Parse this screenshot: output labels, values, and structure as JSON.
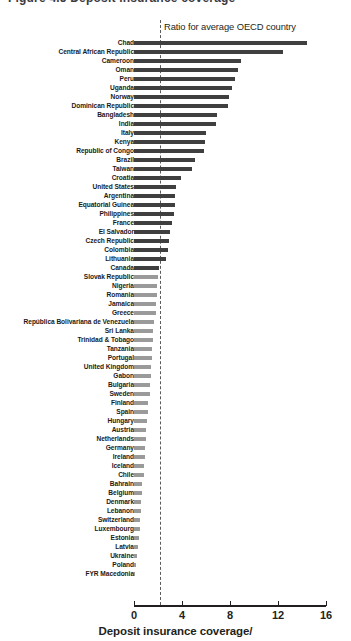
{
  "figure": {
    "partial_title": "Figure 4.5   Deposit insurance coverage",
    "annotation": "Ratio for average OECD country"
  },
  "axis": {
    "ticks": [
      "0",
      "4",
      "8",
      "12",
      "16"
    ],
    "title": "Deposit insurance coverage/"
  },
  "colors": {
    "bar_above": "#3f3f3f",
    "bar_below": "#9a9a9a",
    "axis": "#231f20",
    "reference_line": "#5a5a5a"
  },
  "chart_data": {
    "type": "bar",
    "orientation": "horizontal",
    "title": "Deposit insurance coverage",
    "xlabel": "Deposit insurance coverage/",
    "ylabel": "",
    "xlim": [
      0,
      16
    ],
    "xticks": [
      0,
      4,
      8,
      12,
      16
    ],
    "grid": false,
    "legend": false,
    "annotations": [
      {
        "text": "Ratio for average OECD country",
        "type": "reference-line",
        "x": 2.1,
        "style": "dashed-vertical"
      }
    ],
    "categories": [
      "Chad",
      "Central African Republic",
      "Cameroon",
      "Oman",
      "Peru",
      "Uganda",
      "Norway",
      "Dominican Republic",
      "Bangladesh",
      "India",
      "Italy",
      "Kenya",
      "Republic of Congo",
      "Brazil",
      "Taiwan",
      "Croatia",
      "United States",
      "Argentina",
      "Equatorial Guinea",
      "Philippines",
      "France",
      "El Salvador",
      "Czech Republic",
      "Colombia",
      "Lithuania",
      "Canada",
      "Slovak Republic",
      "Nigeria",
      "Romania",
      "Jamaica",
      "Greece",
      "República Bolivariana de Venezuela",
      "Sri Lanka",
      "Trinidad & Tobago",
      "Tanzania",
      "Portugal",
      "United Kingdom",
      "Gabon",
      "Bulgaria",
      "Sweden",
      "Finland",
      "Spain",
      "Hungary",
      "Austria",
      "Netherlands",
      "Germany",
      "Ireland",
      "Iceland",
      "Chile",
      "Bahrain",
      "Belgium",
      "Denmark",
      "Lebanon",
      "Switzerland",
      "Luxembourg",
      "Estonia",
      "Latvia",
      "Ukraine",
      "Poland",
      "FYR Macedonia"
    ],
    "values": [
      14.4,
      12.4,
      8.9,
      8.7,
      8.4,
      8.2,
      7.9,
      7.8,
      6.9,
      6.8,
      6.0,
      5.9,
      5.8,
      5.1,
      4.8,
      3.9,
      3.5,
      3.4,
      3.4,
      3.3,
      3.2,
      3.0,
      2.9,
      2.8,
      2.7,
      2.1,
      2.0,
      1.9,
      1.9,
      1.8,
      1.8,
      1.7,
      1.6,
      1.6,
      1.5,
      1.5,
      1.4,
      1.4,
      1.3,
      1.3,
      1.2,
      1.2,
      1.1,
      1.0,
      1.0,
      0.9,
      0.9,
      0.8,
      0.8,
      0.7,
      0.7,
      0.6,
      0.6,
      0.5,
      0.5,
      0.4,
      0.3,
      0.25,
      0.2,
      0.1
    ]
  }
}
